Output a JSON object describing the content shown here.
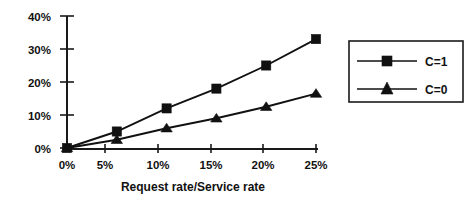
{
  "chart_data": {
    "type": "line",
    "title": "",
    "xlabel": "Request rate/Service rate",
    "ylabel": "",
    "x": [
      0,
      5,
      10,
      15,
      20,
      25
    ],
    "x_tick_labels": [
      "0%",
      "5%",
      "10%",
      "15%",
      "20%",
      "25%"
    ],
    "y_tick_labels": [
      "0%",
      "10%",
      "20%",
      "30%",
      "40%"
    ],
    "y_ticks": [
      0,
      10,
      20,
      30,
      40
    ],
    "xlim": [
      0,
      25
    ],
    "ylim": [
      0,
      40
    ],
    "grid": false,
    "legend_position": "right",
    "series": [
      {
        "name": "C=1",
        "marker": "square",
        "values": [
          0,
          5,
          12,
          18,
          25,
          33
        ]
      },
      {
        "name": "C=0",
        "marker": "triangle",
        "values": [
          0,
          2.5,
          6,
          9,
          12.5,
          16.5
        ]
      }
    ]
  },
  "axes": {
    "x_title": "Request rate/Service rate",
    "x_tick_0": "0%",
    "x_tick_1": "5%",
    "x_tick_2": "10%",
    "x_tick_3": "15%",
    "x_tick_4": "20%",
    "x_tick_5": "25%",
    "y_tick_0": "0%",
    "y_tick_1": "10%",
    "y_tick_2": "20%",
    "y_tick_3": "30%",
    "y_tick_4": "40%"
  },
  "legend": {
    "entry_0_label": "C=1",
    "entry_1_label": "C=0"
  },
  "colors": {
    "ink": "#111111",
    "axis": "#1a1a1a",
    "background": "#ffffff"
  }
}
